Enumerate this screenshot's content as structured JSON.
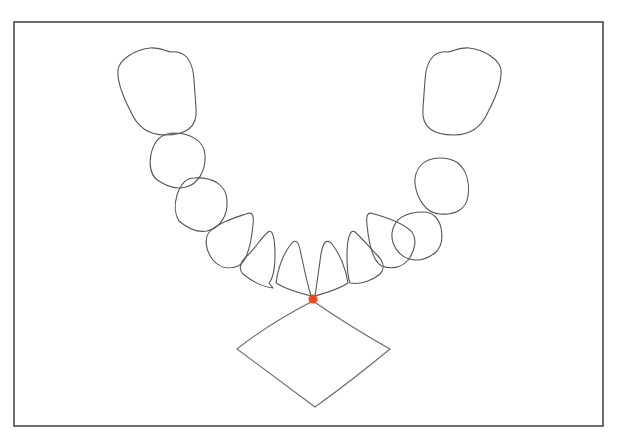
{
  "diagram": {
    "type": "dental-arch-outline",
    "canvas": {
      "width": 619,
      "height": 440,
      "background": "#ffffff"
    },
    "frame": {
      "x": 14,
      "y": 22,
      "width": 589,
      "height": 404,
      "stroke": "#4a4a4a"
    },
    "line_color": "#555555",
    "teeth": [
      {
        "id": "left-molar-2",
        "side": "left",
        "shape": "molar",
        "d": "M 171 52 C 186 50 193 62 194 80 L 196 108 C 198 128 185 135 165 135 C 148 135 137 126 131 112 C 122 95 117 82 118 70 C 119 60 134 50 150 48 C 158 47 165 51 171 52 Z"
      },
      {
        "id": "left-molar-1",
        "side": "left",
        "shape": "premolar",
        "d": "M 172 133 C 190 133 204 140 205 155 C 206 171 198 184 186 187 C 175 190 164 185 156 179 C 151 174 149 165 151 154 C 154 141 160 134 172 133 Z"
      },
      {
        "id": "left-premolar-2",
        "side": "left",
        "shape": "premolar",
        "d": "M 194 178 C 215 177 226 186 227 200 C 228 216 220 228 207 231 C 196 233 186 227 179 221 C 175 215 174 205 177 195 C 180 186 185 178 194 178 Z"
      },
      {
        "id": "left-premolar-1",
        "side": "left",
        "shape": "premolar",
        "d": "M 246 214 C 253 211 254 216 253 225 C 251 245 247 262 238 266 C 228 270 219 267 213 260 C 205 250 204 238 210 231 C 220 222 234 218 246 214 Z"
      },
      {
        "id": "left-canine",
        "side": "left",
        "shape": "canine",
        "d": "M 269 283 L 273 288 C 262 287 250 280 243 274 C 238 269 240 262 248 255 C 256 247 262 237 268 232 C 273 228 275 240 275 255 C 275 268 273 278 269 283 Z"
      },
      {
        "id": "left-lateral-incisor",
        "side": "left",
        "shape": "incisor",
        "d": "M 311 296 C 300 293 287 290 276 283 C 278 268 284 253 291 244 C 296 238 299 242 301 254 C 304 268 307 283 311 296 Z"
      },
      {
        "id": "right-lateral-incisor",
        "side": "right",
        "shape": "incisor",
        "d": "M 315 296 C 325 293 338 290 348 283 C 346 268 339 253 332 244 C 327 238 323 242 321 254 C 319 268 317 283 315 296 Z"
      },
      {
        "id": "right-canine",
        "side": "right",
        "shape": "canine",
        "d": "M 350 283 C 361 285 373 280 380 274 C 385 269 384 262 377 255 C 369 247 361 237 355 232 C 350 228 347 240 347 255 C 347 268 348 278 350 283 Z"
      },
      {
        "id": "right-premolar-1",
        "side": "right",
        "shape": "premolar",
        "d": "M 374 214 C 367 211 366 216 367 225 C 369 245 373 262 382 266 C 392 270 402 267 408 260 C 416 250 417 238 411 231 C 401 222 387 218 374 214 Z"
      },
      {
        "id": "right-premolar-2",
        "side": "right",
        "shape": "premolar",
        "d": "M 424 212 C 405 212 394 219 392 233 C 391 245 399 256 409 259 C 420 262 429 258 436 252 C 441 247 443 238 441 228 C 439 218 432 212 424 212 Z"
      },
      {
        "id": "right-molar-1",
        "side": "right",
        "shape": "premolar",
        "d": "M 440 158 C 422 158 414 170 415 184 C 417 198 425 213 440 214 C 453 215 466 211 468 196 C 470 182 466 170 458 163 C 452 159 446 158 440 158 Z"
      },
      {
        "id": "right-molar-2",
        "side": "right",
        "shape": "molar",
        "d": "M 448 52 C 433 50 426 62 425 80 L 423 108 C 421 128 434 135 454 135 C 471 135 482 126 488 112 C 497 95 502 82 501 70 C 500 60 485 50 469 48 C 461 47 454 51 448 52 Z"
      }
    ],
    "lower_fan": {
      "id": "anterior-fan",
      "vertices": {
        "top": [
          313,
          301
        ],
        "left": [
          237,
          349
        ],
        "right": [
          390,
          349
        ],
        "bottom": [
          315,
          407
        ]
      },
      "d": "M 313 301 Q 270 323 237 349 Q 276 378 315 407 Q 350 382 390 349 Q 349 326 313 301 Z",
      "stroke": "#6a6a6a"
    },
    "midpoint_marker": {
      "cx": 313,
      "cy": 299,
      "r": 4.5,
      "color": "#f04a1c"
    }
  }
}
